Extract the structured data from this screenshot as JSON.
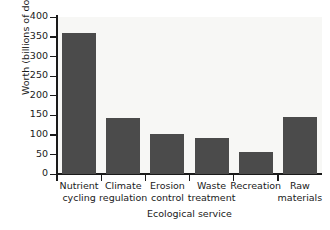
{
  "chart_data": {
    "type": "bar",
    "title": "",
    "xlabel": "Ecological service",
    "ylabel": "Worth (billions of dollars)",
    "categories": [
      "Nutrient cycling",
      "Climate regulation",
      "Erosion control",
      "Waste treatment",
      "Recreation",
      "Raw materials"
    ],
    "category_lines": [
      [
        "Nutrient",
        "cycling"
      ],
      [
        "Climate",
        "regulation"
      ],
      [
        "Erosion",
        "control"
      ],
      [
        "Waste",
        "treatment"
      ],
      [
        "Recreation",
        ""
      ],
      [
        "Raw",
        "materials"
      ]
    ],
    "values": [
      360,
      143,
      102,
      92,
      57,
      145
    ],
    "ylim": [
      0,
      400
    ],
    "ytick_labels": [
      "0",
      "50",
      "100",
      "150",
      "200",
      "250",
      "300",
      "350",
      "400"
    ],
    "ytick_values": [
      0,
      50,
      100,
      150,
      200,
      250,
      300,
      350,
      400
    ],
    "grid": false,
    "legend": "none",
    "bar_color": "#4b4b4b",
    "plot_background": "#f7f7f5",
    "axis_color": "#1a1a1a"
  }
}
